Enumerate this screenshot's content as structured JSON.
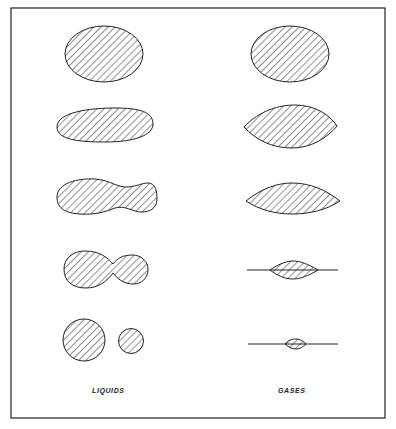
{
  "figure": {
    "columns": [
      {
        "label": "LIQUIDS",
        "stages": [
          "sphere",
          "elongated ellipsoid",
          "necking dumbbell",
          "deep neck",
          "two separated droplets"
        ]
      },
      {
        "label": "GASES",
        "stages": [
          "sphere",
          "lens",
          "flattened lens",
          "thin lens on line",
          "small bead on line"
        ]
      }
    ],
    "colors": {
      "ink": "#222222",
      "background": "#ffffff"
    }
  }
}
